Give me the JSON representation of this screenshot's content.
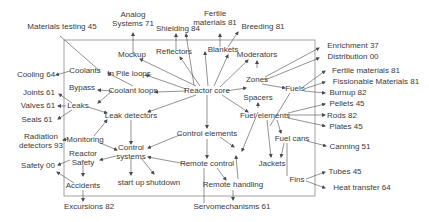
{
  "diagram": {
    "type": "concept-map",
    "colors": {
      "text": "#3a3a3a",
      "edge": "#4a4a4a",
      "frame": "#8a8a8a",
      "background": "#ffffff"
    },
    "frame": {
      "x": 64,
      "y": 40,
      "width": 251,
      "height": 156
    },
    "nodes": [
      {
        "id": "reactor_core",
        "lines": [
          "Reactor core"
        ],
        "x": 207,
        "y": 91,
        "inside": true
      },
      {
        "id": "mockup",
        "lines": [
          "Mockup"
        ],
        "x": 132,
        "y": 55,
        "inside": true
      },
      {
        "id": "reflectors",
        "lines": [
          "Reflectors"
        ],
        "x": 174,
        "y": 52,
        "inside": true
      },
      {
        "id": "blankets",
        "lines": [
          "Blankets"
        ],
        "x": 223,
        "y": 50,
        "inside": true
      },
      {
        "id": "moderators",
        "lines": [
          "Moderators"
        ],
        "x": 257,
        "y": 55,
        "inside": true
      },
      {
        "id": "coolants",
        "lines": [
          "Coolants"
        ],
        "x": 85,
        "y": 71,
        "inside": true
      },
      {
        "id": "in_pile_loops",
        "lines": [
          "In Pile loops"
        ],
        "x": 129,
        "y": 74,
        "inside": true
      },
      {
        "id": "bypass",
        "lines": [
          "Bypass"
        ],
        "x": 82,
        "y": 88,
        "inside": true
      },
      {
        "id": "coolant_loops",
        "lines": [
          "Coolant loops"
        ],
        "x": 133,
        "y": 91,
        "inside": true
      },
      {
        "id": "leaks",
        "lines": [
          "Leaks"
        ],
        "x": 78,
        "y": 106,
        "inside": true
      },
      {
        "id": "leak_detectors",
        "lines": [
          "Leak detectors"
        ],
        "x": 131,
        "y": 116,
        "inside": true
      },
      {
        "id": "monitoring",
        "lines": [
          "Monitoring"
        ],
        "x": 85,
        "y": 140,
        "inside": true
      },
      {
        "id": "control_systems",
        "lines": [
          "Control",
          "systems"
        ],
        "x": 131,
        "y": 152,
        "inside": true
      },
      {
        "id": "reactor_safety",
        "lines": [
          "Reactor",
          "Safety"
        ],
        "x": 83,
        "y": 158,
        "inside": true
      },
      {
        "id": "accidents",
        "lines": [
          "Accidents"
        ],
        "x": 83,
        "y": 186,
        "inside": true
      },
      {
        "id": "start_up",
        "lines": [
          "start up"
        ],
        "x": 131,
        "y": 183,
        "inside": true
      },
      {
        "id": "shutdown",
        "lines": [
          "shutdown"
        ],
        "x": 163,
        "y": 183,
        "inside": true
      },
      {
        "id": "control_elements",
        "lines": [
          "Control elements"
        ],
        "x": 207,
        "y": 134,
        "inside": true
      },
      {
        "id": "remote_control",
        "lines": [
          "Remote control"
        ],
        "x": 207,
        "y": 164,
        "inside": true
      },
      {
        "id": "remote_handling",
        "lines": [
          "Remote handling"
        ],
        "x": 233,
        "y": 185,
        "inside": true
      },
      {
        "id": "zones",
        "lines": [
          "Zones"
        ],
        "x": 257,
        "y": 80,
        "inside": true
      },
      {
        "id": "fuels",
        "lines": [
          "Fuels"
        ],
        "x": 295,
        "y": 89,
        "inside": true
      },
      {
        "id": "spacers",
        "lines": [
          "Spacers"
        ],
        "x": 258,
        "y": 98,
        "inside": true
      },
      {
        "id": "fuel_elements",
        "lines": [
          "Fuel elements"
        ],
        "x": 265,
        "y": 116,
        "inside": true
      },
      {
        "id": "fuel_cans",
        "lines": [
          "Fuel cans"
        ],
        "x": 292,
        "y": 139,
        "inside": true
      },
      {
        "id": "jackets",
        "lines": [
          "Jackets"
        ],
        "x": 272,
        "y": 164,
        "inside": true
      },
      {
        "id": "fins",
        "lines": [
          "Fins"
        ],
        "x": 297,
        "y": 180,
        "inside": true
      },
      {
        "id": "materials_testing",
        "lines": [
          "Materials testing 45"
        ],
        "x": 62,
        "y": 27,
        "inside": false
      },
      {
        "id": "analog_systems",
        "lines": [
          "Analog",
          "Systems 71"
        ],
        "x": 133,
        "y": 19,
        "inside": false
      },
      {
        "id": "shielding",
        "lines": [
          "Shielding 84"
        ],
        "x": 178,
        "y": 29,
        "inside": false
      },
      {
        "id": "fertile_materials_top",
        "lines": [
          "Fertile",
          "materials 81"
        ],
        "x": 215,
        "y": 18,
        "inside": false
      },
      {
        "id": "breeding",
        "lines": [
          "Breeding 81"
        ],
        "x": 263,
        "y": 27,
        "inside": false
      },
      {
        "id": "cooling",
        "lines": [
          "Cooling 64"
        ],
        "x": 36,
        "y": 75,
        "inside": false
      },
      {
        "id": "joints",
        "lines": [
          "Joints 61"
        ],
        "x": 39,
        "y": 93,
        "inside": false
      },
      {
        "id": "valves",
        "lines": [
          "Valves 61"
        ],
        "x": 38,
        "y": 106,
        "inside": false
      },
      {
        "id": "seals",
        "lines": [
          "Seals 61"
        ],
        "x": 37,
        "y": 120,
        "inside": false
      },
      {
        "id": "radiation_detectors",
        "lines": [
          "Radiation",
          "detectors 93"
        ],
        "x": 41,
        "y": 141,
        "inside": false
      },
      {
        "id": "safety",
        "lines": [
          "Safety 00"
        ],
        "x": 38,
        "y": 166,
        "inside": false
      },
      {
        "id": "excursions",
        "lines": [
          "Excursions 82"
        ],
        "x": 89,
        "y": 207,
        "inside": false
      },
      {
        "id": "servomechanisms",
        "lines": [
          "Servomechanisms 61"
        ],
        "x": 232,
        "y": 207,
        "inside": false
      },
      {
        "id": "enrichment",
        "lines": [
          "Enrichment 37"
        ],
        "x": 353,
        "y": 46,
        "inside": false
      },
      {
        "id": "distribution",
        "lines": [
          "Distribution 00"
        ],
        "x": 353,
        "y": 57,
        "inside": false
      },
      {
        "id": "fertile_materials_right",
        "lines": [
          "Fertile materials 81"
        ],
        "x": 366,
        "y": 71,
        "inside": false
      },
      {
        "id": "fissionable_materials",
        "lines": [
          "Fissionable Materials 81"
        ],
        "x": 376,
        "y": 82,
        "inside": false
      },
      {
        "id": "burnup",
        "lines": [
          "Burnup 82"
        ],
        "x": 348,
        "y": 93,
        "inside": false
      },
      {
        "id": "pellets",
        "lines": [
          "Pellets 45"
        ],
        "x": 347,
        "y": 104,
        "inside": false
      },
      {
        "id": "rods",
        "lines": [
          "Rods 82"
        ],
        "x": 342,
        "y": 116,
        "inside": false
      },
      {
        "id": "plates",
        "lines": [
          "Plates 45"
        ],
        "x": 346,
        "y": 127,
        "inside": false
      },
      {
        "id": "canning",
        "lines": [
          "Canning 51"
        ],
        "x": 350,
        "y": 147,
        "inside": false
      },
      {
        "id": "tubes",
        "lines": [
          "Tubes 45"
        ],
        "x": 345,
        "y": 172,
        "inside": false
      },
      {
        "id": "heat_transfer",
        "lines": [
          "Heat transfer 64"
        ],
        "x": 362,
        "y": 188,
        "inside": false
      }
    ],
    "edges": [
      {
        "from": [
          196,
          86
        ],
        "to": [
          140,
          59
        ]
      },
      {
        "from": [
          200,
          86
        ],
        "to": [
          180,
          57
        ]
      },
      {
        "from": [
          208,
          86
        ],
        "to": [
          205,
          52
        ]
      },
      {
        "from": [
          214,
          86
        ],
        "to": [
          228,
          55
        ]
      },
      {
        "from": [
          220,
          87
        ],
        "to": [
          248,
          60
        ]
      },
      {
        "from": [
          186,
          89
        ],
        "to": [
          146,
          75
        ]
      },
      {
        "from": [
          186,
          91
        ],
        "to": [
          155,
          92
        ]
      },
      {
        "from": [
          196,
          95
        ],
        "to": [
          148,
          112
        ]
      },
      {
        "from": [
          207,
          95
        ],
        "to": [
          207,
          128
        ]
      },
      {
        "from": [
          222,
          95
        ],
        "to": [
          248,
          112
        ]
      },
      {
        "from": [
          226,
          91
        ],
        "to": [
          246,
          88
        ]
      },
      {
        "from": [
          257,
          68
        ],
        "to": [
          257,
          61
        ]
      },
      {
        "from": [
          262,
          84
        ],
        "to": [
          285,
          88
        ]
      },
      {
        "from": [
          265,
          77
        ],
        "to": [
          319,
          48
        ]
      },
      {
        "from": [
          265,
          80
        ],
        "to": [
          319,
          58
        ]
      },
      {
        "from": [
          303,
          87
        ],
        "to": [
          325,
          71
        ]
      },
      {
        "from": [
          304,
          89
        ],
        "to": [
          325,
          82
        ]
      },
      {
        "from": [
          304,
          91
        ],
        "to": [
          325,
          93
        ]
      },
      {
        "from": [
          290,
          93
        ],
        "to": [
          270,
          126
        ],
        "arrow": false
      },
      {
        "from": [
          133,
          86
        ],
        "to": [
          108,
          73
        ]
      },
      {
        "from": [
          112,
          91
        ],
        "to": [
          98,
          90
        ]
      },
      {
        "from": [
          112,
          91
        ],
        "to": [
          98,
          103
        ]
      },
      {
        "from": [
          70,
          71
        ],
        "to": [
          56,
          75
        ]
      },
      {
        "from": [
          72,
          103
        ],
        "to": [
          59,
          94
        ]
      },
      {
        "from": [
          66,
          106
        ],
        "to": [
          58,
          106
        ]
      },
      {
        "from": [
          72,
          110
        ],
        "to": [
          58,
          119
        ]
      },
      {
        "from": [
          88,
          107
        ],
        "to": [
          107,
          113
        ]
      },
      {
        "from": [
          94,
          136
        ],
        "to": [
          107,
          120
        ]
      },
      {
        "from": [
          131,
          120
        ],
        "to": [
          131,
          144
        ]
      },
      {
        "from": [
          98,
          142
        ],
        "to": [
          117,
          150
        ]
      },
      {
        "from": [
          182,
          134
        ],
        "to": [
          148,
          148
        ]
      },
      {
        "from": [
          207,
          139
        ],
        "to": [
          207,
          158
        ]
      },
      {
        "from": [
          186,
          164
        ],
        "to": [
          148,
          157
        ]
      },
      {
        "from": [
          116,
          156
        ],
        "to": [
          100,
          160
        ]
      },
      {
        "from": [
          68,
          139
        ],
        "to": [
          63,
          140
        ]
      },
      {
        "from": [
          70,
          160
        ],
        "to": [
          58,
          165
        ]
      },
      {
        "from": [
          83,
          165
        ],
        "to": [
          83,
          176
        ]
      },
      {
        "from": [
          74,
          183
        ],
        "to": [
          57,
          172
        ]
      },
      {
        "from": [
          83,
          190
        ],
        "to": [
          83,
          201
        ]
      },
      {
        "from": [
          131,
          158
        ],
        "to": [
          131,
          175
        ]
      },
      {
        "from": [
          141,
          158
        ],
        "to": [
          154,
          174
        ]
      },
      {
        "from": [
          204,
          168
        ],
        "to": [
          204,
          203
        ],
        "arrow": false
      },
      {
        "from": [
          217,
          168
        ],
        "to": [
          226,
          180
        ]
      },
      {
        "from": [
          233,
          190
        ],
        "to": [
          233,
          200
        ]
      },
      {
        "from": [
          238,
          179
        ],
        "to": [
          236,
          156
        ]
      },
      {
        "from": [
          220,
          137
        ],
        "to": [
          234,
          147
        ]
      },
      {
        "from": [
          258,
          112
        ],
        "to": [
          242,
          151
        ]
      },
      {
        "from": [
          258,
          108
        ],
        "to": [
          258,
          103
        ]
      },
      {
        "from": [
          267,
          120
        ],
        "to": [
          271,
          157
        ]
      },
      {
        "from": [
          277,
          120
        ],
        "to": [
          281,
          133
        ]
      },
      {
        "from": [
          284,
          143
        ],
        "to": [
          281,
          157
        ]
      },
      {
        "from": [
          287,
          143
        ],
        "to": [
          287,
          176
        ],
        "arrow": false
      },
      {
        "from": [
          288,
          113
        ],
        "to": [
          325,
          104
        ]
      },
      {
        "from": [
          288,
          115
        ],
        "to": [
          325,
          115
        ]
      },
      {
        "from": [
          288,
          118
        ],
        "to": [
          325,
          126
        ]
      },
      {
        "from": [
          307,
          141
        ],
        "to": [
          326,
          146
        ]
      },
      {
        "from": [
          306,
          179
        ],
        "to": [
          325,
          172
        ]
      },
      {
        "from": [
          306,
          181
        ],
        "to": [
          325,
          188
        ]
      },
      {
        "from": [
          60,
          36
        ],
        "to": [
          100,
          71
        ],
        "arrow": false
      },
      {
        "from": [
          133,
          54
        ],
        "to": [
          133,
          33
        ],
        "arrow": true
      },
      {
        "from": [
          176,
          50
        ],
        "to": [
          176,
          34
        ]
      },
      {
        "from": [
          194,
          85
        ],
        "to": [
          186,
          34
        ]
      },
      {
        "from": [
          220,
          47
        ],
        "to": [
          220,
          34
        ]
      },
      {
        "from": [
          228,
          47
        ],
        "to": [
          238,
          32
        ]
      }
    ]
  }
}
